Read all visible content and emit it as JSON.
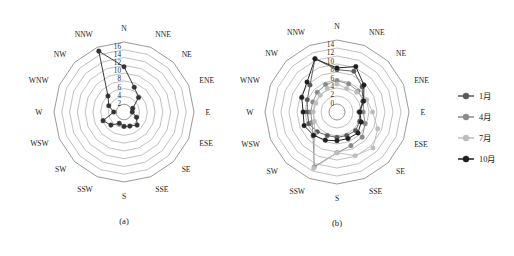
{
  "figure": {
    "background": "#ffffff",
    "panels": [
      {
        "id": "a",
        "caption": "(a)",
        "center": {
          "x": 124,
          "y": 112
        },
        "outer_radius": 70,
        "directions": [
          "N",
          "NNE",
          "NE",
          "ENE",
          "E",
          "ESE",
          "SE",
          "SSE",
          "S",
          "SSW",
          "SW",
          "WSW",
          "W",
          "WNW",
          "NW",
          "NNW"
        ],
        "radial_ticks": [
          "2",
          "4",
          "6",
          "8",
          "10",
          "12",
          "14",
          "16"
        ],
        "radial_tick_values": [
          2,
          4,
          6,
          8,
          10,
          12,
          14,
          16
        ],
        "r_min": 0,
        "r_max": 17,
        "ring_count": 9
      },
      {
        "id": "b",
        "caption": "(b)",
        "center": {
          "x": 337,
          "y": 112
        },
        "outer_radius": 72,
        "directions": [
          "N",
          "NNE",
          "NE",
          "ENE",
          "E",
          "ESE",
          "SE",
          "SSE",
          "S",
          "SSW",
          "SW",
          "WSW",
          "W",
          "WNW",
          "NW",
          "NNW"
        ],
        "radial_ticks": [
          "0",
          "2",
          "4",
          "6",
          "8",
          "10",
          "12",
          "14"
        ],
        "radial_tick_values": [
          0,
          2,
          4,
          6,
          8,
          10,
          12,
          14
        ],
        "r_min": -2,
        "r_max": 15,
        "ring_count": 9
      }
    ],
    "legend": {
      "position": "right",
      "x": 458,
      "y": 96,
      "items": [
        {
          "label": "1月",
          "color": "#5a5a5a",
          "marker": "circle"
        },
        {
          "label": "4月",
          "color": "#8a8a8a",
          "marker": "circle"
        },
        {
          "label": "7月",
          "color": "#bdbdbd",
          "marker": "circle"
        },
        {
          "label": "10月",
          "color": "#1f1f1f",
          "marker": "circle"
        }
      ]
    }
  },
  "chart_data": [
    {
      "type": "line",
      "subtype": "radar",
      "title": "(a)",
      "xlabel": "",
      "ylabel": "",
      "categories": [
        "N",
        "NNE",
        "NE",
        "ENE",
        "E",
        "ESE",
        "SE",
        "SSE",
        "S",
        "SSW",
        "SW",
        "WSW",
        "W",
        "WNW",
        "NW",
        "NNW"
      ],
      "ylim": [
        0,
        17
      ],
      "ytick_labels": [
        "2",
        "4",
        "6",
        "8",
        "10",
        "12",
        "14",
        "16"
      ],
      "grid": true,
      "legend": "none",
      "series": [
        {
          "name": "全年",
          "color": "#333333",
          "values": [
            11.0,
            6.5,
            5.0,
            2.3,
            2.0,
            3.3,
            4.5,
            3.7,
            3.5,
            3.0,
            4.5,
            5.5,
            2.5,
            4.0,
            5.5,
            16.0
          ]
        }
      ]
    },
    {
      "type": "line",
      "subtype": "radar",
      "title": "(b)",
      "xlabel": "",
      "ylabel": "",
      "categories": [
        "N",
        "NNE",
        "NE",
        "ENE",
        "E",
        "ESE",
        "SE",
        "SSE",
        "S",
        "SSW",
        "SW",
        "WSW",
        "W",
        "WNW",
        "NW",
        "NNW"
      ],
      "ylim": [
        -2,
        15
      ],
      "ytick_labels": [
        "0",
        "2",
        "4",
        "6",
        "8",
        "10",
        "12",
        "14"
      ],
      "grid": true,
      "legend": "right",
      "series": [
        {
          "name": "1月",
          "color": "#5a5a5a",
          "values": [
            8.0,
            8.4,
            6.4,
            4.6,
            3.2,
            3.8,
            4.2,
            4.0,
            4.0,
            4.0,
            4.6,
            5.2,
            5.0,
            5.6,
            7.0,
            11.6
          ]
        },
        {
          "name": "4月",
          "color": "#8a8a8a",
          "values": [
            5.4,
            5.2,
            5.0,
            4.8,
            4.2,
            5.2,
            6.4,
            6.6,
            7.6,
            12.0,
            6.0,
            4.4,
            4.2,
            4.2,
            4.6,
            5.0
          ]
        },
        {
          "name": "7月",
          "color": "#bdbdbd",
          "values": [
            4.6,
            4.0,
            4.6,
            5.6,
            6.4,
            8.4,
            10.0,
            9.2,
            7.6,
            12.4,
            5.4,
            3.8,
            3.6,
            3.4,
            3.6,
            4.0
          ]
        },
        {
          "name": "10月",
          "color": "#1f1f1f",
          "values": [
            8.4,
            9.6,
            7.0,
            4.8,
            3.4,
            4.2,
            5.0,
            4.8,
            4.8,
            5.2,
            5.8,
            6.4,
            6.0,
            7.0,
            8.0,
            11.6
          ]
        }
      ]
    }
  ]
}
